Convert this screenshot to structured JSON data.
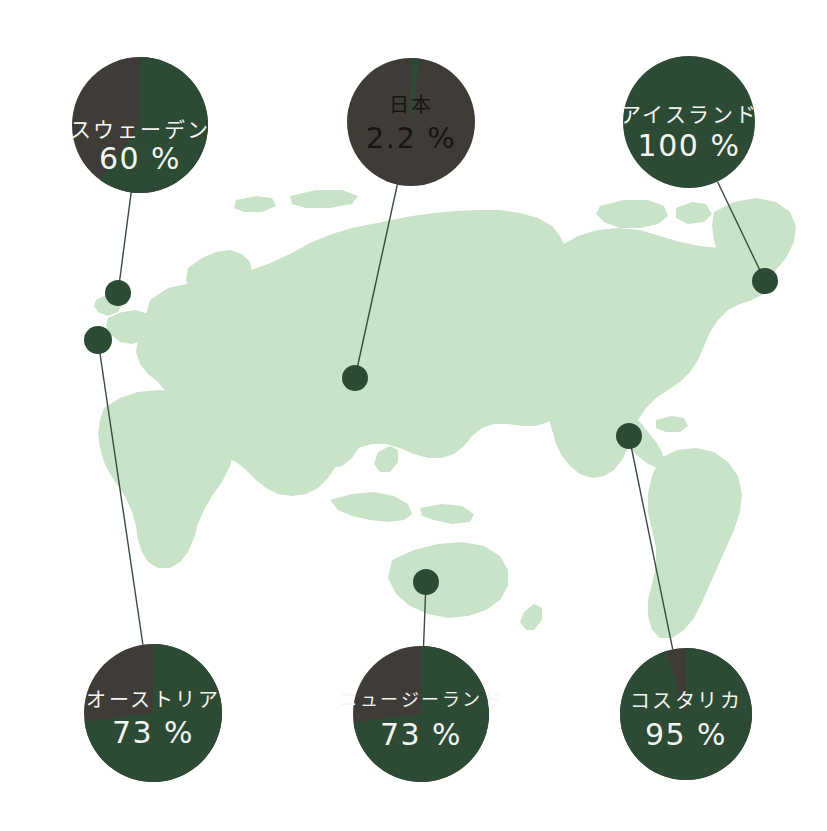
{
  "figure": {
    "type": "map-with-pies",
    "background_color": "#ffffff",
    "map_fill_color": "#c8e3c8",
    "accent_green": "#2d4a35",
    "muted_gray": "#3f3c38",
    "connector_color": "#3c4a40",
    "label_light_color": "#f2f4f0",
    "label_dark_color": "#151515"
  },
  "chart_data": {
    "type": "pie",
    "title": "",
    "unit": "%",
    "legend": [],
    "series_names": [
      "renewable share",
      "remaining share"
    ],
    "items": [
      {
        "name": "スウェーデン",
        "value": 60,
        "value_label": "60 %",
        "remainder": 40,
        "pie": {
          "cx": 140,
          "cy": 125,
          "r": 68
        },
        "marker": {
          "cx": 118,
          "cy": 293,
          "r": 13
        },
        "text_color": "#f2f4f0",
        "label_dy": 12,
        "value_dy": 44,
        "label_size": 21,
        "value_size": 30
      },
      {
        "name": "日本",
        "value": 2.2,
        "value_label": "2.2 %",
        "remainder": 97.8,
        "pie": {
          "cx": 411,
          "cy": 122,
          "r": 64
        },
        "marker": {
          "cx": 355,
          "cy": 378,
          "r": 13
        },
        "text_color": "#151515",
        "label_dy": -10,
        "value_dy": 26,
        "label_size": 20,
        "value_size": 29
      },
      {
        "name": "アイスランド",
        "value": 100,
        "value_label": "100 %",
        "remainder": 0,
        "pie": {
          "cx": 689,
          "cy": 122,
          "r": 66
        },
        "marker": {
          "cx": 765,
          "cy": 281,
          "r": 13
        },
        "text_color": "#f2f4f0",
        "label_dy": 0,
        "value_dy": 34,
        "label_size": 21,
        "value_size": 30
      },
      {
        "name": "オーストリア",
        "value": 73,
        "value_label": "73 %",
        "remainder": 27,
        "pie": {
          "cx": 153,
          "cy": 713,
          "r": 69
        },
        "marker": {
          "cx": 98,
          "cy": 340,
          "r": 14
        },
        "text_color": "#f2f4f0",
        "label_dy": -6,
        "value_dy": 30,
        "label_size": 20,
        "value_size": 30
      },
      {
        "name": "ニュージーランド",
        "value": 73,
        "value_label": "73 %",
        "remainder": 27,
        "pie": {
          "cx": 421,
          "cy": 714,
          "r": 68
        },
        "marker": {
          "cx": 426,
          "cy": 582,
          "r": 13
        },
        "text_color": "#f2f4f0",
        "label_dy": -8,
        "value_dy": 31,
        "label_size": 18,
        "value_size": 30
      },
      {
        "name": "コスタリカ",
        "value": 95,
        "value_label": "95 %",
        "remainder": 5,
        "pie": {
          "cx": 686,
          "cy": 714,
          "r": 66
        },
        "marker": {
          "cx": 629,
          "cy": 436,
          "r": 13
        },
        "text_color": "#f2f4f0",
        "label_dy": -6,
        "value_dy": 31,
        "label_size": 20,
        "value_size": 30
      }
    ]
  }
}
